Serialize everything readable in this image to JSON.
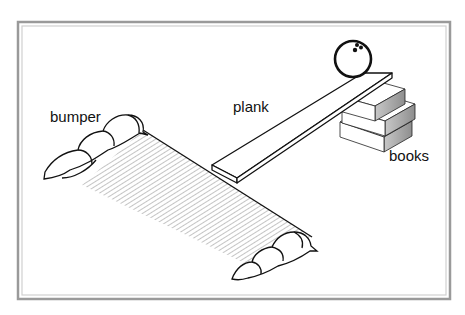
{
  "figure": {
    "type": "diagram",
    "labels": {
      "bumper": "bumper",
      "plank": "plank",
      "books": "books"
    },
    "colors": {
      "frame_outer": "#9a9a9a",
      "frame_inner": "#cfcfcf",
      "line": "#111111",
      "hatch": "#8a8a8a",
      "book_shade": "#9c9c9c",
      "background": "#ffffff"
    }
  }
}
